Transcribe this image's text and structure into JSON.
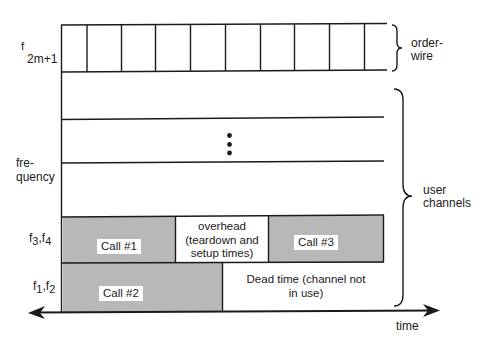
{
  "colors": {
    "line": "#1a1a1a",
    "call_fill": "#b8b8b8",
    "background": "#ffffff"
  },
  "axis": {
    "y_label_line1": "fre-",
    "y_label_line2": "quency",
    "x_label": "time",
    "top_freq_label_main": "f",
    "top_freq_label_sub": "2m+1"
  },
  "rows": {
    "f3f4": {
      "label_f1": "f",
      "label_sub1": "3",
      "label_sep": ",f",
      "label_sub2": "4",
      "segments": [
        {
          "label": "Call #1",
          "type": "call"
        },
        {
          "label_line1": "overhead",
          "label_line2": "(teardown and",
          "label_line3": "setup times)",
          "type": "overhead"
        },
        {
          "label": "Call #3",
          "type": "call"
        }
      ]
    },
    "f1f2": {
      "label_f1": "f",
      "label_sub1": "1",
      "label_sep": ",f",
      "label_sub2": "2",
      "segments": [
        {
          "label": "Call #2",
          "type": "call"
        },
        {
          "label_line1": "Dead time (channel not",
          "label_line2": "in use)",
          "type": "dead"
        }
      ]
    }
  },
  "braces": {
    "orderwire_line1": "order-",
    "orderwire_line2": "wire",
    "user_line1": "user",
    "user_line2": "channels"
  },
  "ellipsis": "vertical-dots"
}
